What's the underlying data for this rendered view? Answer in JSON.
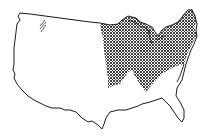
{
  "map": {
    "subject": "Contiguous United States outline",
    "highlighted_region": "Upper Midwest and Northeast (cross-hatched)",
    "minor_marking": "Small diagonal hatch mark in the northwest interior",
    "colors": {
      "background": "#ffffff",
      "outline": "#1a1a1a",
      "hatch": "#2a2a2a"
    }
  }
}
